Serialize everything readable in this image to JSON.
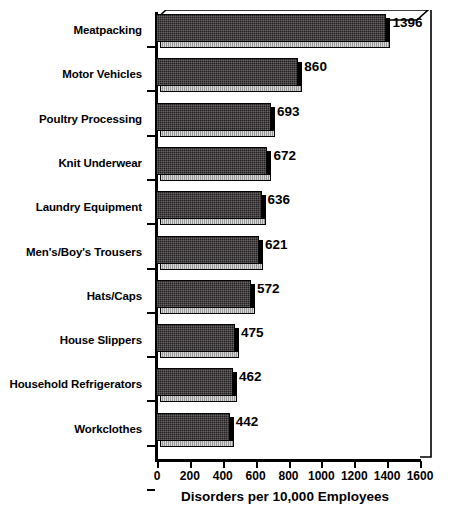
{
  "chart_data": {
    "type": "bar",
    "orientation": "horizontal",
    "title": "",
    "xlabel": "Disorders per 10,000 Employees",
    "ylabel": "",
    "xlim": [
      0,
      1600
    ],
    "xticks": [
      0,
      200,
      400,
      600,
      800,
      1000,
      1200,
      1400,
      1600
    ],
    "xtick_labels": [
      "0",
      "200",
      "400",
      "600",
      "800",
      "1000",
      "1200",
      "1400",
      "1600"
    ],
    "grid": false,
    "legend": null,
    "style": "3d-bar",
    "categories": [
      "Meatpacking",
      "Motor Vehicles",
      "Poultry Processing",
      "Knit Underwear",
      "Laundry Equipment",
      "Men's/Boy's Trousers",
      "Hats/Caps",
      "House Slippers",
      "Household Refrigerators",
      "Workclothes"
    ],
    "values": [
      1396,
      860,
      693,
      672,
      636,
      621,
      572,
      475,
      462,
      442
    ],
    "data_labels": [
      "1396",
      "860",
      "693",
      "672",
      "636",
      "621",
      "572",
      "475",
      "462",
      "442"
    ],
    "colors": {
      "bar_face": "#231f20",
      "bar_bottom": "#a8a8a8",
      "outline": "#000000",
      "background": "#ffffff",
      "text": "#000000"
    }
  }
}
